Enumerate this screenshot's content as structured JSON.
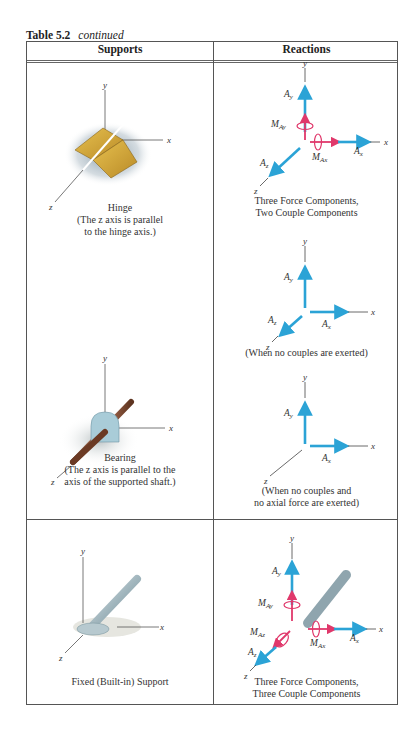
{
  "caption": {
    "number": "Table 5.2",
    "suffix": "continued"
  },
  "table": {
    "headers": [
      "Supports",
      "Reactions"
    ],
    "rows": [
      {
        "support": {
          "name": "Hinge",
          "note": [
            "(The z axis is parallel",
            "to the hinge axis.)"
          ],
          "axes": [
            "x",
            "y",
            "z"
          ]
        },
        "reactions": [
          {
            "labels": [
              "Ay",
              "MAy",
              "MAx",
              "Ax",
              "Az"
            ],
            "caption": [
              "Three Force Components,",
              "Two Couple Components"
            ]
          },
          {
            "labels": [
              "Ay",
              "Ax",
              "Az"
            ],
            "caption": [
              "(When no couples are exerted)"
            ]
          }
        ]
      },
      {
        "support": {
          "name": "Bearing",
          "note": [
            "(The z axis is parallel to the",
            "axis of the supported shaft.)"
          ],
          "axes": [
            "x",
            "y",
            "z"
          ]
        },
        "reactions": [
          {
            "labels": [
              "Ay",
              "Ax"
            ],
            "caption": [
              "(When no couples and",
              "no axial force are exerted)"
            ]
          }
        ]
      },
      {
        "support": {
          "name": "Fixed (Built-in) Support",
          "note": [],
          "axes": [
            "x",
            "y",
            "z"
          ]
        },
        "reactions": [
          {
            "labels": [
              "Ay",
              "MAy",
              "MAz",
              "MAx",
              "Ax",
              "Az"
            ],
            "caption": [
              "Three Force Components,",
              "Three Couple Components"
            ]
          }
        ]
      }
    ]
  },
  "colors": {
    "force": "#2ba3d6",
    "couple": "#e0386b",
    "axis": "#444444"
  }
}
